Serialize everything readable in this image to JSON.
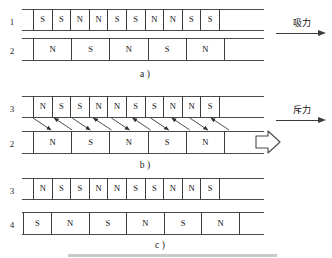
{
  "figure": {
    "ink_color": "#3d3d3d",
    "rail_color": "#4a4a4a",
    "gray_bar_color": "#c9c9c9"
  },
  "panels": [
    {
      "id": "a",
      "caption": "a )",
      "force_label": "吸力",
      "rows": [
        {
          "label": "1",
          "cells": [
            "S",
            "S",
            "N",
            "N",
            "S",
            "S",
            "N",
            "N",
            "S",
            "S"
          ]
        },
        {
          "label": "2",
          "cells": [
            "N",
            "S",
            "N",
            "S",
            "N"
          ]
        }
      ]
    },
    {
      "id": "b",
      "caption": "b )",
      "force_label": "斥力",
      "motion_arrow": "hollow-right-arrow",
      "rows": [
        {
          "label": "3",
          "cells": [
            "N",
            "S",
            "S",
            "N",
            "N",
            "S",
            "S",
            "N",
            "N",
            "S"
          ]
        },
        {
          "label": "2",
          "cells": [
            "N",
            "S",
            "N",
            "S",
            "N"
          ]
        }
      ]
    },
    {
      "id": "c",
      "caption": "c )",
      "rows": [
        {
          "label": "3",
          "cells": [
            "N",
            "S",
            "S",
            "N",
            "N",
            "S",
            "S",
            "N",
            "N",
            "S"
          ]
        },
        {
          "label": "4",
          "cells": [
            "S",
            "N",
            "S",
            "N",
            "S",
            "N"
          ]
        }
      ]
    }
  ]
}
